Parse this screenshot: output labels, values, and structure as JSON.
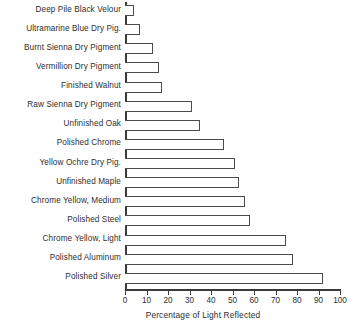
{
  "chart_data": {
    "type": "bar",
    "orientation": "horizontal",
    "title": "",
    "xlabel": "Percentage of Light Reflected",
    "ylabel": "",
    "xlim": [
      0,
      100
    ],
    "xticks": [
      0,
      10,
      20,
      30,
      40,
      50,
      60,
      70,
      80,
      90,
      100
    ],
    "grid": false,
    "legend": null,
    "bar_style": {
      "fill": "#ffffff",
      "edge": "#4a4a4a",
      "edge_width_px": 1.5
    },
    "axis_color": "#3a3a3a",
    "text_color": "#2e2e2e",
    "background": "#ffffff",
    "categories": [
      "Deep Pile Black Velour",
      "Ultramarine Blue Dry Pig.",
      "Burnt Sienna Dry Pigment",
      "Vermillion Dry Pigment",
      "Finished Walnut",
      "Raw Sienna Dry Pigment",
      "Unfinished Oak",
      "Polished Chrome",
      "Yellow Ochre Dry Pig.",
      "Unfinished Maple",
      "Chrome Yellow, Medium",
      "Polished Steel",
      "Chrome Yellow, Light",
      "Polished Aluminum",
      "Polished Silver"
    ],
    "values": [
      4,
      7,
      13,
      16,
      17,
      31,
      35,
      46,
      51,
      53,
      56,
      58,
      75,
      78,
      92
    ]
  }
}
